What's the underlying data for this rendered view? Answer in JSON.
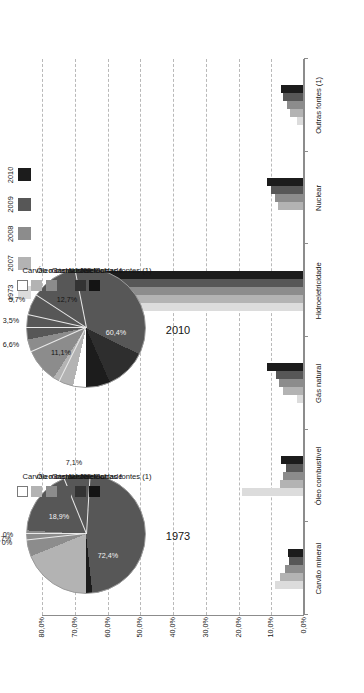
{
  "chart_data": {
    "type": "bar",
    "title": "",
    "xlabel": "",
    "ylabel": "",
    "ylim": [
      0,
      80
    ],
    "grid": true,
    "legend_position": "top-right",
    "ytick_labels": [
      "0,0%",
      "10,0%",
      "20,0%",
      "30,0%",
      "40,0%",
      "50,0%",
      "60,0%",
      "70,0%",
      "80,0%"
    ],
    "ytick_values": [
      0,
      10,
      20,
      30,
      40,
      50,
      60,
      70,
      80
    ],
    "categories": [
      "Carvão mineral",
      "Óleo combustível",
      "Gás natural",
      "Hidroeletricidade",
      "Nuclear",
      "Outras fontes (1)"
    ],
    "series": [
      {
        "name": "1973",
        "color": "#dcdcdc",
        "values": [
          8.5,
          18.6,
          1.7,
          74.0,
          0.0,
          1.7
        ]
      },
      {
        "name": "2007",
        "color": "#b3b3b3",
        "values": [
          7.0,
          7.0,
          6.1,
          69.0,
          7.5,
          4.0
        ]
      },
      {
        "name": "2008",
        "color": "#8c8c8c",
        "values": [
          5.6,
          6.0,
          7.2,
          66.0,
          8.6,
          5.0
        ]
      },
      {
        "name": "2009",
        "color": "#575757",
        "values": [
          4.2,
          5.2,
          8.4,
          63.2,
          9.8,
          6.0
        ]
      },
      {
        "name": "2010",
        "color": "#1c1c1c",
        "values": [
          4.6,
          6.6,
          11.1,
          60.4,
          11.1,
          6.6
        ]
      }
    ],
    "pies": [
      {
        "year": "1973",
        "slices": [
          {
            "label": "Carvão mineral",
            "value_label": "0%",
            "value": 0.0,
            "color": "#ffffff"
          },
          {
            "label": "Óleo combustível",
            "value_label": "18,9%",
            "value": 18.9,
            "color": "#b3b3b3"
          },
          {
            "label": "Gás natural",
            "value_label": "7,1%",
            "value": 7.1,
            "color": "#8c8c8c"
          },
          {
            "label": "Hidroeletricidade",
            "value_label": "72,4%",
            "value": 72.4,
            "color": "#575757"
          },
          {
            "label": "Nuclear",
            "value_label": "0%",
            "value": 0.0,
            "color": "#3a3a3a"
          },
          {
            "label": "Outras fontes (1)",
            "value_label": "1,7%",
            "value": 1.7,
            "color": "#1c1c1c"
          }
        ]
      },
      {
        "year": "2010",
        "slices": [
          {
            "label": "Carvão mineral",
            "value_label": "3,5%",
            "value": 3.5,
            "color": "#ffffff"
          },
          {
            "label": "Óleo combustível",
            "value_label": "5,7%",
            "value": 5.7,
            "color": "#b3b3b3"
          },
          {
            "label": "Gás natural",
            "value_label": "12,7%",
            "value": 12.7,
            "color": "#8c8c8c"
          },
          {
            "label": "Hidroeletricidade",
            "value_label": "60,4%",
            "value": 60.4,
            "color": "#575757"
          },
          {
            "label": "Nuclear",
            "value_label": "11,1%",
            "value": 11.1,
            "color": "#2e2e2e"
          },
          {
            "label": "Outras fontes (1)",
            "value_label": "6,6%",
            "value": 6.6,
            "color": "#1c1c1c"
          }
        ]
      }
    ]
  },
  "year_legend": {
    "items": [
      {
        "label": "1973",
        "color": "#dcdcdc"
      },
      {
        "label": "2007",
        "color": "#b3b3b3"
      },
      {
        "label": "2008",
        "color": "#8c8c8c"
      },
      {
        "label": "2009",
        "color": "#575757"
      },
      {
        "label": "2010",
        "color": "#1c1c1c"
      }
    ]
  },
  "source_legend": {
    "items": [
      {
        "label": "Carvão mineral",
        "color": "#ffffff",
        "border": "#7a7a7a"
      },
      {
        "label": "Óleo combustível",
        "color": "#b3b3b3",
        "border": "#b3b3b3"
      },
      {
        "label": "Gás natural",
        "color": "#8c8c8c",
        "border": "#8c8c8c"
      },
      {
        "label": "Hidroeletricidade",
        "color": "#575757",
        "border": "#575757"
      },
      {
        "label": "Nuclear",
        "color": "#333333",
        "border": "#333333"
      },
      {
        "label": "Outras fontes (1)",
        "color": "#141414",
        "border": "#141414"
      }
    ]
  },
  "pie_titles": {
    "left": "1973",
    "right": "2010"
  }
}
